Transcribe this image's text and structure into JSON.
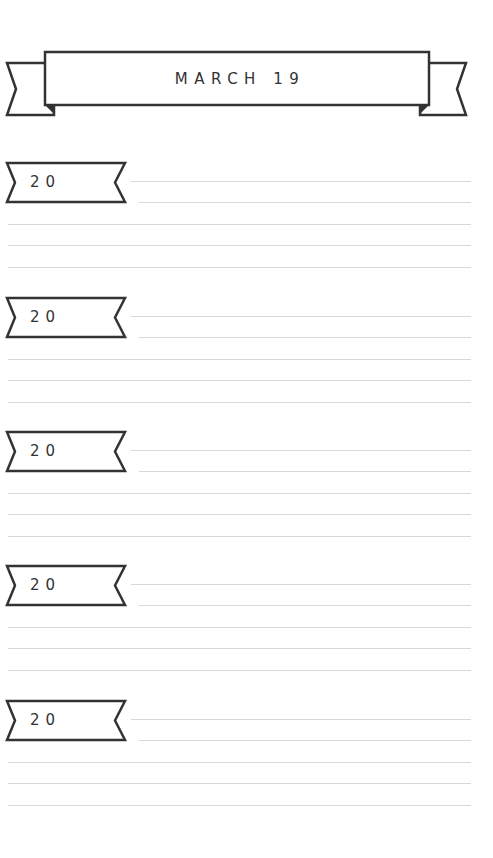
{
  "header": {
    "title": "MARCH 19"
  },
  "sections": [
    {
      "tag_label": "20",
      "top": 162
    },
    {
      "tag_label": "20",
      "top": 297
    },
    {
      "tag_label": "20",
      "top": 431
    },
    {
      "tag_label": "20",
      "top": 565
    },
    {
      "tag_label": "20",
      "top": 700
    }
  ],
  "colors": {
    "ink": "#333333",
    "rule": "#d8d8d8",
    "background": "#ffffff"
  }
}
